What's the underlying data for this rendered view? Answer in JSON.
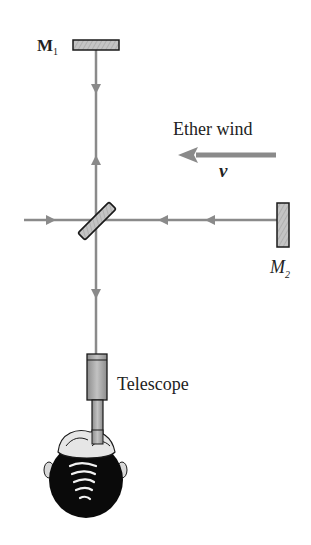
{
  "diagram": {
    "labels": {
      "mirror1": {
        "main": "M",
        "sub": "1"
      },
      "mirror2": {
        "main": "M",
        "sub": "2"
      },
      "ether_wind": "Ether wind",
      "velocity": "v",
      "telescope": "Telescope"
    },
    "components": [
      {
        "id": "mirror-1",
        "type": "mirror",
        "orientation": "horizontal"
      },
      {
        "id": "mirror-2",
        "type": "mirror",
        "orientation": "vertical"
      },
      {
        "id": "beam-splitter",
        "type": "half-silvered mirror",
        "orientation": "45deg"
      },
      {
        "id": "telescope",
        "type": "telescope"
      },
      {
        "id": "observer-head",
        "type": "observer"
      }
    ],
    "beams": [
      {
        "path": "source -> splitter",
        "direction": "right"
      },
      {
        "path": "splitter -> M1",
        "direction": "up"
      },
      {
        "path": "M1 -> splitter",
        "direction": "down"
      },
      {
        "path": "splitter -> M2",
        "direction": "right"
      },
      {
        "path": "M2 -> splitter",
        "direction": "left"
      },
      {
        "path": "splitter -> telescope",
        "direction": "down"
      }
    ],
    "ether_wind_direction": "left",
    "colors": {
      "beam": "#8a8a8a",
      "mirror_fill": "#b8b8b8",
      "outline": "#1a1a1a",
      "text": "#222222",
      "hair": "#0a0a0a"
    }
  }
}
